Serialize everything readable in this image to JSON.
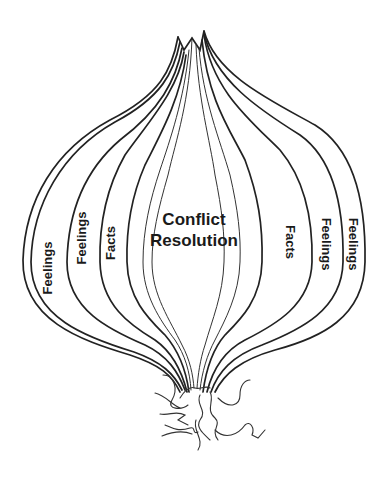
{
  "diagram": {
    "type": "onion-layers",
    "center": {
      "line1": "Conflict",
      "line2": "Resolution"
    },
    "left_layers": [
      {
        "label": "Feelings",
        "position": "outer"
      },
      {
        "label": "Feelings",
        "position": "middle"
      },
      {
        "label": "Facts",
        "position": "inner"
      }
    ],
    "right_layers": [
      {
        "label": "Facts",
        "position": "inner"
      },
      {
        "label": "Feelings",
        "position": "middle"
      },
      {
        "label": "Feelings",
        "position": "outer"
      }
    ],
    "colors": {
      "stroke": "#222222",
      "text": "#1a1a1a",
      "background": "#ffffff"
    }
  }
}
